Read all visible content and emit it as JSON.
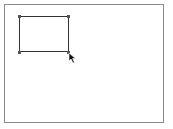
{
  "canvas": {
    "frame_color": "#8a8a8a",
    "background": "#ffffff"
  },
  "shape": {
    "type": "rectangle",
    "stroke_color": "#333333",
    "selected": true,
    "handles": [
      "top-left",
      "top-right",
      "bottom-left",
      "bottom-right"
    ]
  },
  "cursor": {
    "icon": "arrow-pointer-icon"
  }
}
